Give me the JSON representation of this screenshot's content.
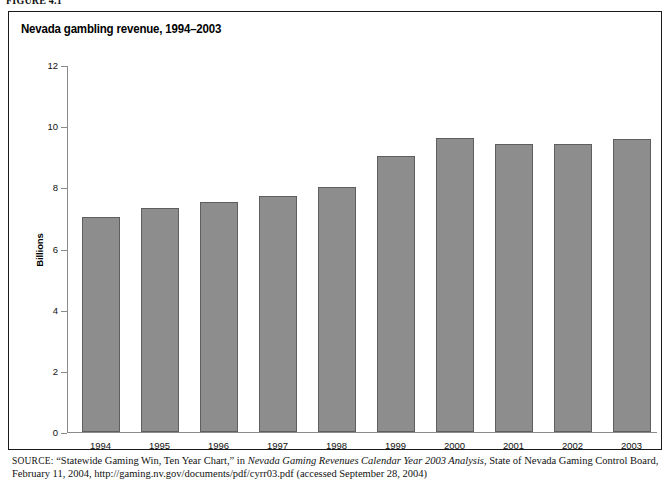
{
  "figure_label": "FIGURE 4.1",
  "chart_title": "Nevada gambling revenue, 1994–2003",
  "source": {
    "kicker": "SOURCE:",
    "part1": " “Statewide Gaming Win, Ten Year Chart,” in ",
    "italic": "Nevada Gaming Revenues Calendar Year 2003 Analysis,",
    "part2": " State of Nevada Gaming Control Board, February 11, 2004, http://gaming.nv.gov/documents/pdf/cyrr03.pdf (accessed September 28, 2004)"
  },
  "colors": {
    "bar_fill": "#8d8d8d",
    "bar_stroke": "#5e5e5e",
    "axis": "#8a8a8a",
    "frame": "#1a1a1a",
    "text": "#111111"
  },
  "chart_data": {
    "type": "bar",
    "title": "Nevada gambling revenue, 1994–2003",
    "xlabel": "",
    "ylabel": "Billions",
    "categories": [
      "1994",
      "1995",
      "1996",
      "1997",
      "1998",
      "1999",
      "2000",
      "2001",
      "2002",
      "2003"
    ],
    "values": [
      7.0,
      7.3,
      7.5,
      7.7,
      8.0,
      9.0,
      9.6,
      9.4,
      9.4,
      9.55
    ],
    "ylim": [
      0,
      12
    ],
    "yticks": [
      0,
      2,
      4,
      6,
      8,
      10,
      12
    ],
    "ytick_labels": [
      "0",
      "2",
      "4",
      "6",
      "8",
      "10",
      "12"
    ],
    "grid": false,
    "legend": null
  }
}
